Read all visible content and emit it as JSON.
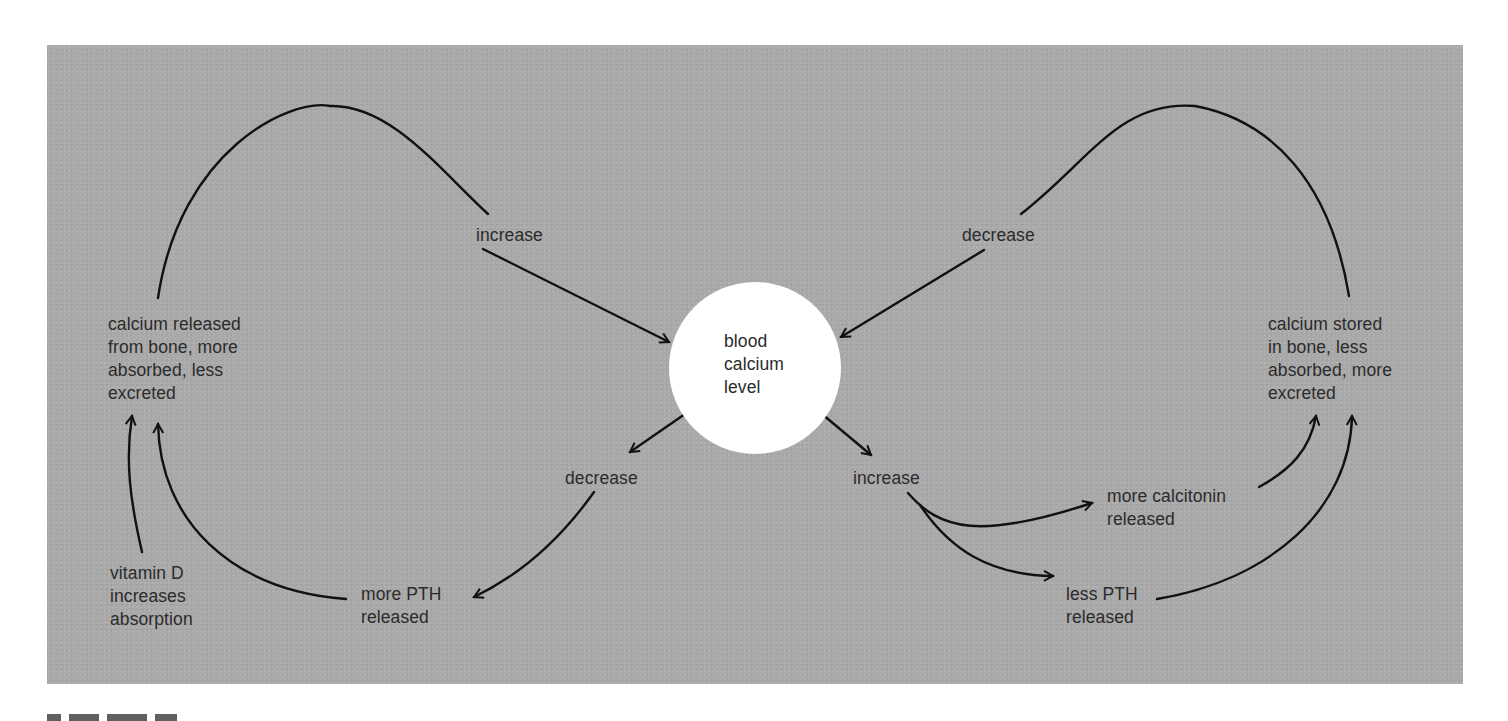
{
  "diagram": {
    "center_node": {
      "label": "blood\ncalcium\nlevel"
    },
    "left_outcome": {
      "label": "calcium released\nfrom bone, more\nabsorbed, less\nexcreted"
    },
    "right_outcome": {
      "label": "calcium stored\nin bone, less\nabsorbed, more\nexcreted"
    },
    "top_left_loop": {
      "label": "increase"
    },
    "top_right_loop": {
      "label": "decrease"
    },
    "bottom_left_branch": {
      "label": "decrease"
    },
    "bottom_right_branch": {
      "label": "increase"
    },
    "more_pth": {
      "label": "more PTH\nreleased"
    },
    "vitamin_d": {
      "label": "vitamin D\nincreases\nabsorption"
    },
    "more_calcitonin": {
      "label": "more calcitonin\nreleased"
    },
    "less_pth": {
      "label": "less PTH\nreleased"
    },
    "colors": {
      "background_panel": "#a9a9a9",
      "center_fill": "#ffffff",
      "stroke": "#111111",
      "text": "#2b2b2b"
    }
  },
  "caption": {
    "visible": "clipped"
  }
}
